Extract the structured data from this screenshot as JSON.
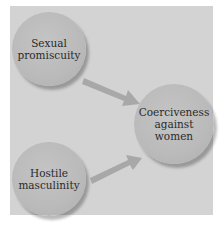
{
  "diagram": {
    "type": "causal-path-diagram",
    "nodes": [
      {
        "id": "sexual-promiscuity",
        "label_lines": [
          "Sexual",
          "promiscuity"
        ]
      },
      {
        "id": "hostile-masculinity",
        "label_lines": [
          "Hostile",
          "masculinity"
        ]
      },
      {
        "id": "coerciveness-against-women",
        "label_lines": [
          "Coerciveness",
          "against",
          "women"
        ]
      }
    ],
    "edges": [
      {
        "from": "sexual-promiscuity",
        "to": "coerciveness-against-women"
      },
      {
        "from": "hostile-masculinity",
        "to": "coerciveness-against-women"
      }
    ]
  },
  "colors": {
    "background": "#ffffff",
    "panel": "#d3d3d3",
    "node": "#bcbcbc",
    "arrow": "#a9a9a9",
    "text": "#2a2a2a"
  }
}
